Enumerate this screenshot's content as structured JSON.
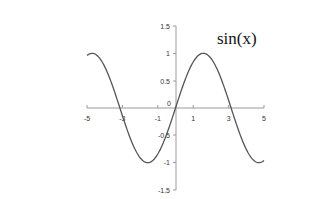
{
  "chart_data": {
    "type": "line",
    "title": "sin(x)",
    "xlabel": "",
    "ylabel": "",
    "xlim": [
      -5,
      5
    ],
    "ylim": [
      -1.5,
      1.5
    ],
    "x_ticks": [
      "-5",
      "-3",
      "-1",
      "1",
      "3",
      "5"
    ],
    "x_tick_values": [
      -5,
      -3,
      -1,
      1,
      3,
      5
    ],
    "y_ticks": [
      "1.5",
      "1",
      "0.5",
      "0",
      "-0.5",
      "-1",
      "-1.5"
    ],
    "y_tick_values": [
      1.5,
      1,
      0.5,
      0,
      -0.5,
      -1,
      -1.5
    ],
    "grid": false,
    "legend": null,
    "series": [
      {
        "name": "sin(x)",
        "color": "#555555",
        "x": [
          -5,
          -4.5,
          -4,
          -3.5,
          -3,
          -2.5,
          -2,
          -1.5,
          -1,
          -0.5,
          0,
          0.5,
          1,
          1.5,
          2,
          2.5,
          3,
          3.5,
          4,
          4.5,
          5
        ],
        "values": [
          0.959,
          0.978,
          0.757,
          0.351,
          -0.141,
          -0.599,
          -0.909,
          -0.997,
          -0.841,
          -0.479,
          0,
          0.479,
          0.841,
          0.997,
          0.909,
          0.599,
          0.141,
          -0.351,
          -0.757,
          -0.978,
          -0.959
        ]
      }
    ],
    "annotations": [
      {
        "text": "sin(x)",
        "position": "upper right of y-axis"
      }
    ]
  },
  "labels": {
    "title": "sin(x)",
    "x0": "-5",
    "x1": "-3",
    "x2": "-1",
    "x3": "1",
    "x4": "3",
    "x5": "5",
    "y0": "1.5",
    "y1": "1",
    "y2": "0.5",
    "y3": "0",
    "y4": "-0.5",
    "y5": "-1",
    "y6": "-1.5"
  }
}
